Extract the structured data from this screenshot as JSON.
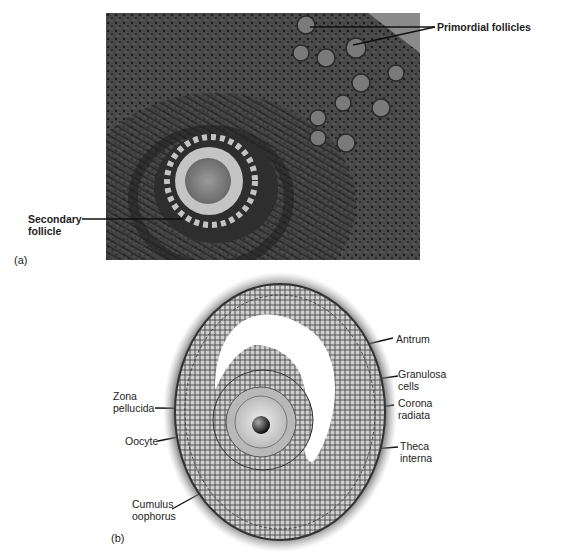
{
  "panel_a": {
    "tag": "(a)",
    "labels": {
      "primordial": "Primordial follicles",
      "secondary_line1": "Secondary",
      "secondary_line2": "follicle"
    }
  },
  "panel_b": {
    "tag": "(b)",
    "labels": {
      "antrum": "Antrum",
      "granulosa_line1": "Granulosa",
      "granulosa_line2": "cells",
      "corona_line1": "Corona",
      "corona_line2": "radiata",
      "theca_line1": "Theca",
      "theca_line2": "interna",
      "zona_line1": "Zona",
      "zona_line2": "pellucida",
      "oocyte": "Oocyte",
      "cumulus_line1": "Cumulus",
      "cumulus_line2": "oophorus"
    }
  }
}
